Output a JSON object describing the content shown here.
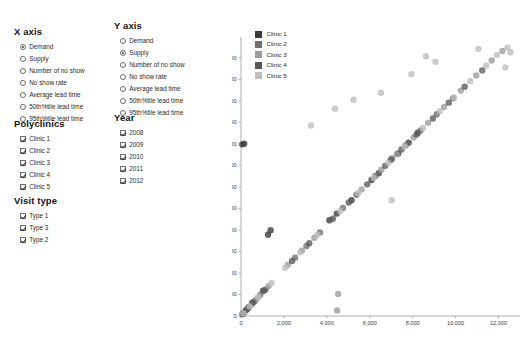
{
  "controls": {
    "x_axis": {
      "title": "X axis",
      "type": "radio",
      "selected": "Demand",
      "options": [
        "Demand",
        "Supply",
        "Number of no show",
        "No show rate",
        "Average lead time",
        "50th%tile lead time",
        "95th%tile lead time"
      ]
    },
    "y_axis": {
      "title": "Y axis",
      "type": "radio",
      "selected": "Supply",
      "options": [
        "Demand",
        "Supply",
        "Number of no show",
        "No show rate",
        "Average lead time",
        "50th%tile lead time",
        "95th%tile lead time"
      ]
    },
    "polyclinics": {
      "title": "Polyclinics",
      "type": "checkbox",
      "options": [
        {
          "label": "Clinic 1",
          "checked": true
        },
        {
          "label": "Clinic 2",
          "checked": true
        },
        {
          "label": "Clinic 3",
          "checked": true
        },
        {
          "label": "Clinic 4",
          "checked": true
        },
        {
          "label": "Clinic 5",
          "checked": true
        }
      ]
    },
    "year": {
      "title": "Year",
      "type": "checkbox",
      "options": [
        {
          "label": "2008",
          "checked": true
        },
        {
          "label": "2009",
          "checked": true
        },
        {
          "label": "2010",
          "checked": true
        },
        {
          "label": "2011",
          "checked": true
        },
        {
          "label": "2012",
          "checked": true
        }
      ]
    },
    "visit_type": {
      "title": "Visit type",
      "type": "checkbox",
      "options": [
        {
          "label": "Type 1",
          "checked": true
        },
        {
          "label": "Type 3",
          "checked": true
        },
        {
          "label": "Type 2",
          "checked": true
        }
      ]
    }
  },
  "chart_data": {
    "type": "scatter",
    "title": "",
    "xlabel": "",
    "ylabel": "",
    "xlim": [
      0,
      13000
    ],
    "ylim": [
      0,
      12600
    ],
    "grid": false,
    "legend_position": "top-left",
    "xticks": [
      0,
      2000,
      4000,
      6000,
      8000,
      10000,
      12000
    ],
    "xtick_labels": [
      "0",
      "2,000",
      "4,000",
      "6,000",
      "8,000",
      "10,000",
      "12,000"
    ],
    "yticks": [
      0,
      1000,
      2000,
      3000,
      4000,
      5000,
      6000,
      7000,
      8000,
      9000,
      10000,
      11000,
      12000
    ],
    "ytick_labels": [
      "0",
      "1,000",
      "2,000",
      "3,000",
      "4,000",
      "5,000",
      "6,000",
      "7,000",
      "8,000",
      "9,000",
      "10,000",
      "11,000",
      "12,000"
    ],
    "legend": [
      {
        "name": "Clinic 1",
        "color": "#3b3b3b"
      },
      {
        "name": "Clinic 2",
        "color": "#6e6e6e"
      },
      {
        "name": "Clinic 3",
        "color": "#9b9b9b"
      },
      {
        "name": "Clinic 4",
        "color": "#5a5a5a"
      },
      {
        "name": "Clinic 5",
        "color": "#bdbdbd"
      }
    ],
    "series": [
      {
        "name": "Clinic 1",
        "color": "#3b3b3b",
        "points": [
          [
            120,
            130
          ],
          [
            210,
            250
          ],
          [
            360,
            420
          ],
          [
            520,
            610
          ],
          [
            1030,
            1180
          ],
          [
            1260,
            3780
          ],
          [
            1380,
            3990
          ],
          [
            4120,
            4450
          ],
          [
            4460,
            4760
          ],
          [
            5150,
            5380
          ],
          [
            6080,
            6320
          ],
          [
            6420,
            6640
          ],
          [
            6980,
            7260
          ],
          [
            7320,
            7560
          ],
          [
            7810,
            8060
          ],
          [
            8240,
            8520
          ],
          [
            60,
            7980
          ],
          [
            150,
            8010
          ]
        ]
      },
      {
        "name": "Clinic 2",
        "color": "#6e6e6e",
        "points": [
          [
            90,
            110
          ],
          [
            330,
            360
          ],
          [
            640,
            700
          ],
          [
            900,
            990
          ],
          [
            1150,
            1240
          ],
          [
            2520,
            2710
          ],
          [
            3050,
            3260
          ],
          [
            3680,
            3880
          ],
          [
            4750,
            5020
          ],
          [
            5380,
            5640
          ],
          [
            6260,
            6510
          ],
          [
            7040,
            7320
          ],
          [
            7680,
            7940
          ],
          [
            8360,
            8620
          ],
          [
            9120,
            9380
          ],
          [
            9880,
            10120
          ]
        ]
      },
      {
        "name": "Clinic 3",
        "color": "#9b9b9b",
        "points": [
          [
            140,
            160
          ],
          [
            480,
            520
          ],
          [
            760,
            830
          ],
          [
            1280,
            1390
          ],
          [
            2180,
            2380
          ],
          [
            2840,
            3040
          ],
          [
            3420,
            3640
          ],
          [
            4480,
            260
          ],
          [
            4530,
            1020
          ],
          [
            5620,
            5880
          ],
          [
            6540,
            6800
          ],
          [
            7260,
            7520
          ],
          [
            8040,
            8300
          ],
          [
            8720,
            8980
          ],
          [
            9460,
            9720
          ],
          [
            10240,
            10480
          ],
          [
            10960,
            11180
          ],
          [
            11680,
            11880
          ],
          [
            12180,
            12320
          ]
        ]
      },
      {
        "name": "Clinic 4",
        "color": "#5a5a5a",
        "points": [
          [
            70,
            80
          ],
          [
            280,
            310
          ],
          [
            560,
            620
          ],
          [
            1090,
            1180
          ],
          [
            2380,
            2560
          ],
          [
            3180,
            3380
          ],
          [
            4280,
            4520
          ],
          [
            5020,
            5280
          ],
          [
            5880,
            6120
          ],
          [
            6720,
            6980
          ],
          [
            7480,
            7740
          ],
          [
            8180,
            8440
          ],
          [
            8940,
            9180
          ],
          [
            9680,
            9920
          ],
          [
            10420,
            10660
          ],
          [
            11240,
            11420
          ]
        ]
      },
      {
        "name": "Clinic 5",
        "color": "#bdbdbd",
        "points": [
          [
            110,
            120
          ],
          [
            400,
            440
          ],
          [
            820,
            890
          ],
          [
            1420,
            1540
          ],
          [
            2060,
            2240
          ],
          [
            2760,
            2960
          ],
          [
            3560,
            3780
          ],
          [
            4620,
            4880
          ],
          [
            5460,
            5720
          ],
          [
            6180,
            6420
          ],
          [
            6860,
            7120
          ],
          [
            7020,
            5380
          ],
          [
            7620,
            7880
          ],
          [
            8480,
            8740
          ],
          [
            9260,
            9520
          ],
          [
            9920,
            10160
          ],
          [
            10680,
            10920
          ],
          [
            11420,
            11640
          ],
          [
            11920,
            12140
          ],
          [
            12320,
            11560
          ],
          [
            12560,
            12260
          ],
          [
            9060,
            11820
          ],
          [
            7940,
            11240
          ],
          [
            6520,
            10380
          ],
          [
            11060,
            12420
          ],
          [
            4380,
            9640
          ],
          [
            5240,
            10060
          ],
          [
            3260,
            8860
          ],
          [
            12420,
            12480
          ],
          [
            8620,
            12080
          ]
        ]
      }
    ]
  }
}
